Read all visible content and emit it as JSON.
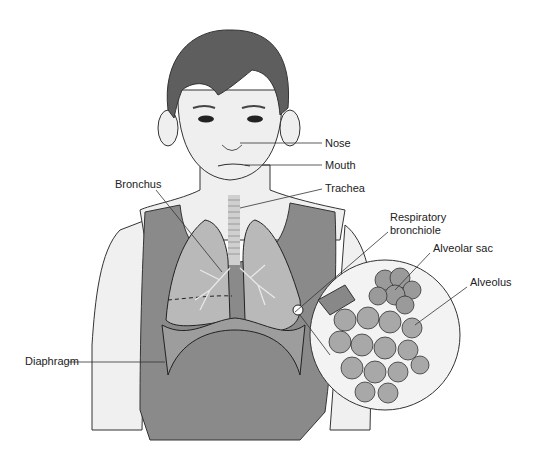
{
  "diagram": {
    "labels": {
      "nose": "Nose",
      "mouth": "Mouth",
      "trachea": "Trachea",
      "bronchus": "Bronchus",
      "respiratory_line1": "Respiratory",
      "respiratory_line2": "bronchiole",
      "alveolar_sac": "Alveolar sac",
      "alveolus": "Alveolus",
      "diaphragm": "Diaphragm"
    },
    "colors": {
      "hair": "#5e5e5e",
      "skin": "#efefef",
      "shirt": "#8a8a8a",
      "lung": "#b9b9b9",
      "outline": "#222222"
    }
  }
}
